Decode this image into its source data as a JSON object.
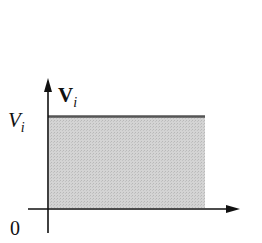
{
  "diagram": {
    "type": "constant-level plot",
    "y_axis_label": {
      "main": "V",
      "sub": "i",
      "style": "bold"
    },
    "level_label": {
      "main": "V",
      "sub": "i",
      "style": "italic"
    },
    "origin_label": "0",
    "colors": {
      "axis": "#111111",
      "level_line": "#555555",
      "fill": "#cfcfcf"
    }
  }
}
